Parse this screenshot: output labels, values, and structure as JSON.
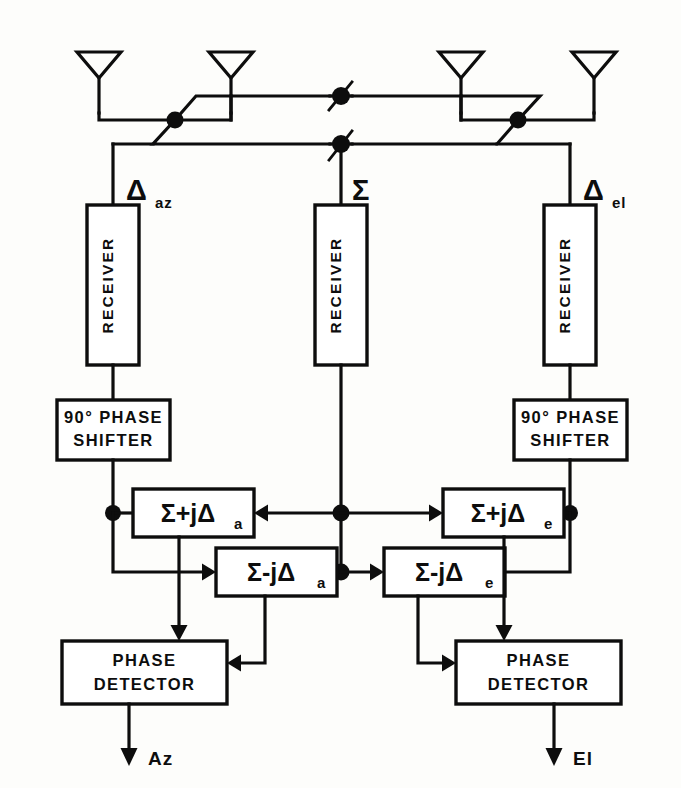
{
  "figure": {
    "ink_color": "#0d0d0d",
    "background_color": "#fdfdfb"
  },
  "antennas": [
    {
      "name": "antenna-1",
      "label": ""
    },
    {
      "name": "antenna-2",
      "label": ""
    },
    {
      "name": "antenna-3",
      "label": ""
    },
    {
      "name": "antenna-4",
      "label": ""
    }
  ],
  "ports": {
    "delta_az": {
      "symbol": "Δ",
      "subscript": "az"
    },
    "sum": {
      "symbol": "Σ",
      "subscript": ""
    },
    "delta_el": {
      "symbol": "Δ",
      "subscript": "el"
    }
  },
  "receivers": [
    {
      "label": "RECEIVER"
    },
    {
      "label": "RECEIVER"
    },
    {
      "label": "RECEIVER"
    }
  ],
  "phase_shifters": [
    {
      "line1": "90° PHASE",
      "line2": "SHIFTER"
    },
    {
      "line1": "90° PHASE",
      "line2": "SHIFTER"
    }
  ],
  "combiners": [
    {
      "id": "sum-plus-j-delta-a",
      "expr": "Σ+jΔ",
      "sub": "a"
    },
    {
      "id": "sum-minus-j-delta-a",
      "expr": "Σ-jΔ",
      "sub": "a"
    },
    {
      "id": "sum-plus-j-delta-e",
      "expr": "Σ+jΔ",
      "sub": "e"
    },
    {
      "id": "sum-minus-j-delta-e",
      "expr": "Σ-jΔ",
      "sub": "e"
    }
  ],
  "phase_detectors": [
    {
      "line1": "PHASE",
      "line2": "DETECTOR"
    },
    {
      "line1": "PHASE",
      "line2": "DETECTOR"
    }
  ],
  "outputs": [
    {
      "label": "Az"
    },
    {
      "label": "El"
    }
  ]
}
